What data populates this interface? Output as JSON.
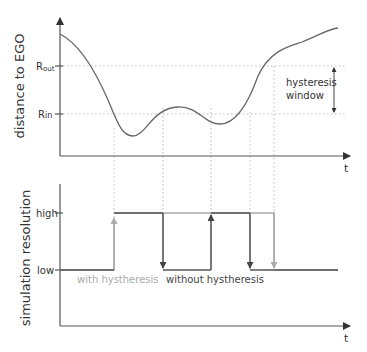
{
  "top_plot": {
    "ylabel": "distance to EGO",
    "xlabel": "t",
    "r_out": {
      "main": "R",
      "sub": "out"
    },
    "r_in": {
      "main": "R",
      "sub": "in"
    },
    "annotation_line1": "hysteresis",
    "annotation_line2": "window"
  },
  "bottom_plot": {
    "ylabel": "simulation resolution",
    "xlabel": "t",
    "high_label": "high",
    "low_label": "low",
    "legend_with": "with hystheresis",
    "legend_without": "without hystheresis"
  },
  "colors": {
    "axis": "#555555",
    "curve": "#666666",
    "without": "#555555",
    "with": "#aaaaaa",
    "grid": "#bbbbbb"
  }
}
